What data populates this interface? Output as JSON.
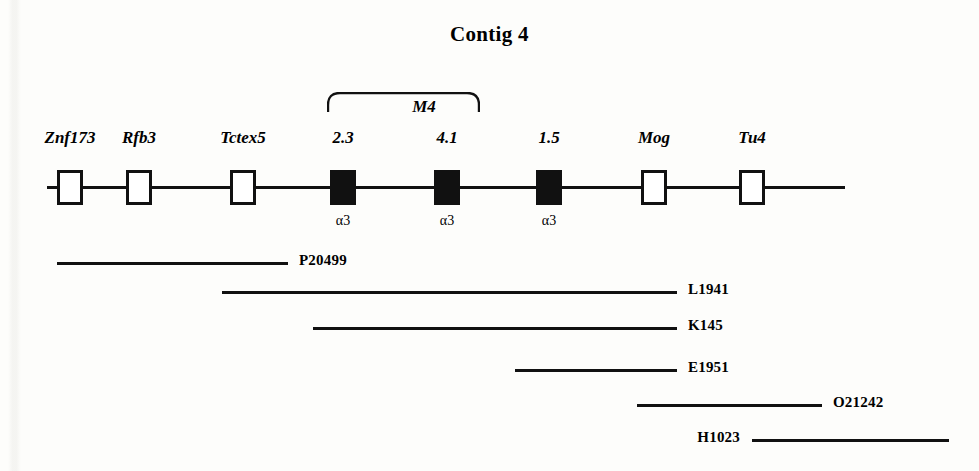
{
  "figure": {
    "title": "Contig 4",
    "backbone": {
      "x_start": 47,
      "x_end": 845,
      "y": 186
    },
    "genes": [
      {
        "label": "Znf173",
        "x": 70,
        "filled": false,
        "sub_label": ""
      },
      {
        "label": "Rfb3",
        "x": 139,
        "filled": false,
        "sub_label": ""
      },
      {
        "label": "Tctex5",
        "x": 243,
        "filled": false,
        "sub_label": ""
      },
      {
        "label": "2.3",
        "x": 343,
        "filled": true,
        "sub_label": "α3"
      },
      {
        "label": "4.1",
        "x": 447,
        "filled": true,
        "sub_label": "α3"
      },
      {
        "label": "1.5",
        "x": 549,
        "filled": true,
        "sub_label": "α3"
      },
      {
        "label": "Mog",
        "x": 654,
        "filled": false,
        "sub_label": ""
      },
      {
        "label": "Tu4",
        "x": 752,
        "filled": false,
        "sub_label": ""
      }
    ],
    "bracket": {
      "label": "M4",
      "x_start": 327,
      "x_end": 480,
      "y": 92,
      "height": 20,
      "label_x": 424,
      "label_y": 97
    },
    "clones": [
      {
        "name": "P20499",
        "x_start": 57,
        "x_end": 288,
        "y": 262,
        "label_side": "right"
      },
      {
        "name": "L1941",
        "x_start": 222,
        "x_end": 677,
        "y": 291,
        "label_side": "right"
      },
      {
        "name": "K145",
        "x_start": 313,
        "x_end": 677,
        "y": 327,
        "label_side": "right"
      },
      {
        "name": "E1951",
        "x_start": 515,
        "x_end": 677,
        "y": 369,
        "label_side": "right"
      },
      {
        "name": "O21242",
        "x_start": 637,
        "x_end": 822,
        "y": 404,
        "label_side": "right"
      },
      {
        "name": "H1023",
        "x_start": 752,
        "x_end": 949,
        "y": 439,
        "label_side": "left"
      }
    ]
  }
}
